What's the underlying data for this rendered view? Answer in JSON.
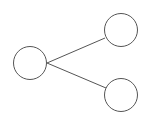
{
  "diagram": {
    "type": "tree",
    "stroke_color": "#555555",
    "fill_color": "#ffffff",
    "nodes": [
      {
        "id": "root",
        "cx": 30,
        "cy": 63,
        "r": 16.5,
        "label": ""
      },
      {
        "id": "child-top",
        "cx": 121,
        "cy": 30,
        "r": 16.5,
        "label": ""
      },
      {
        "id": "child-bottom",
        "cx": 121,
        "cy": 95,
        "r": 16.5,
        "label": ""
      }
    ],
    "edges": [
      {
        "from": "root",
        "to": "child-top",
        "x1": 47,
        "y1": 63,
        "x2": 105,
        "y2": 38
      },
      {
        "from": "root",
        "to": "child-bottom",
        "x1": 47,
        "y1": 63,
        "x2": 106,
        "y2": 88
      }
    ]
  }
}
